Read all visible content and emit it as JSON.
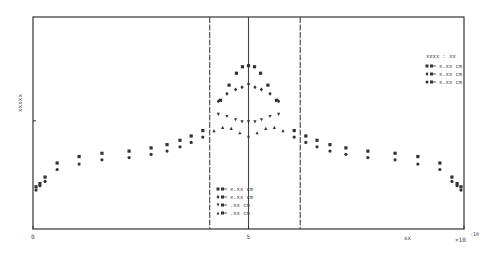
{
  "chart_data": {
    "type": "scatter",
    "title": "",
    "xlabel": "xx",
    "ylabel": "xxxxx",
    "x_multiplier": "×10⁻¹⁰",
    "x_multiplier_base": "×10",
    "x_multiplier_exp": "-10",
    "xlim": [
      0,
      10
    ],
    "ylim": [
      0,
      1.96
    ],
    "x_ticks": [
      {
        "value": 0,
        "label": "0"
      },
      {
        "value": 5,
        "label": "5"
      },
      {
        "value": 10,
        "label": ""
      }
    ],
    "y_ticks": [
      {
        "value": 1,
        "label": ""
      }
    ],
    "grid": false,
    "vertical_lines": [
      {
        "x": 4.1,
        "style": "dashed"
      },
      {
        "x": 5.0,
        "style": "solid"
      },
      {
        "x": 6.2,
        "style": "dashed"
      }
    ],
    "legends": [
      {
        "position": "upper-right",
        "title": "xxxx : xx",
        "entries": [
          {
            "marker": "square",
            "label": "x.xx cm"
          },
          {
            "marker": "diamond",
            "label": "x.xx cm"
          },
          {
            "marker": "circle",
            "label": "x.xx cm"
          }
        ]
      },
      {
        "position": "lower-center",
        "title": "",
        "entries": [
          {
            "marker": "square",
            "label": "x.xx cm"
          },
          {
            "marker": "diamond",
            "label": "x.xx cm"
          },
          {
            "marker": "inverted-triangle",
            "label": ".xx cm"
          },
          {
            "marker": "triangle",
            "label": ".xx cm"
          }
        ]
      }
    ],
    "series": [
      {
        "name": "outer-upper",
        "marker": "square",
        "x": [
          0.07,
          0.16,
          0.28,
          0.56,
          1.07,
          1.6,
          2.23,
          2.74,
          3.11,
          3.41,
          3.67,
          3.94,
          6.06,
          6.33,
          6.59,
          6.89,
          7.26,
          7.77,
          8.4,
          8.93,
          9.44,
          9.72,
          9.84,
          9.93
        ],
        "y": [
          0.39,
          0.42,
          0.48,
          0.61,
          0.67,
          0.7,
          0.72,
          0.75,
          0.78,
          0.82,
          0.86,
          0.91,
          0.91,
          0.86,
          0.82,
          0.78,
          0.75,
          0.72,
          0.7,
          0.67,
          0.61,
          0.48,
          0.42,
          0.39
        ]
      },
      {
        "name": "outer-lower",
        "marker": "circle",
        "x": [
          0.07,
          0.16,
          0.28,
          0.56,
          1.07,
          1.6,
          2.23,
          2.74,
          3.11,
          3.41,
          3.67,
          3.94,
          6.06,
          6.33,
          6.59,
          6.89,
          7.26,
          7.77,
          8.4,
          8.93,
          9.44,
          9.72,
          9.84,
          9.93
        ],
        "y": [
          0.36,
          0.4,
          0.44,
          0.55,
          0.6,
          0.64,
          0.66,
          0.69,
          0.72,
          0.76,
          0.8,
          0.85,
          0.85,
          0.8,
          0.76,
          0.72,
          0.69,
          0.66,
          0.64,
          0.6,
          0.55,
          0.44,
          0.4,
          0.36
        ]
      },
      {
        "name": "x.xx cm (square)",
        "marker": "square",
        "x": [
          4.35,
          4.55,
          4.72,
          4.86,
          5.0,
          5.14,
          5.28,
          5.45,
          5.65
        ],
        "y": [
          1.19,
          1.33,
          1.44,
          1.5,
          1.51,
          1.5,
          1.44,
          1.33,
          1.19
        ]
      },
      {
        "name": "x.xx cm (diamond)",
        "marker": "diamond",
        "x": [
          4.3,
          4.5,
          4.7,
          4.85,
          5.0,
          5.15,
          5.3,
          5.5,
          5.7
        ],
        "y": [
          1.18,
          1.25,
          1.29,
          1.31,
          1.34,
          1.31,
          1.29,
          1.25,
          1.18
        ]
      },
      {
        "name": ".xx cm (inverted-triangle)",
        "marker": "inverted-triangle",
        "x": [
          4.3,
          4.5,
          4.7,
          4.85,
          5.0,
          5.15,
          5.3,
          5.5,
          5.7
        ],
        "y": [
          1.06,
          1.04,
          1.01,
          0.99,
          0.99,
          0.99,
          1.01,
          1.04,
          1.06
        ]
      },
      {
        "name": ".xx cm (triangle)",
        "marker": "triangle",
        "x": [
          4.2,
          4.4,
          4.6,
          4.8,
          5.0,
          5.2,
          5.4,
          5.6,
          5.8
        ],
        "y": [
          0.91,
          0.94,
          0.93,
          0.89,
          0.86,
          0.89,
          0.93,
          0.94,
          0.91
        ]
      }
    ]
  }
}
